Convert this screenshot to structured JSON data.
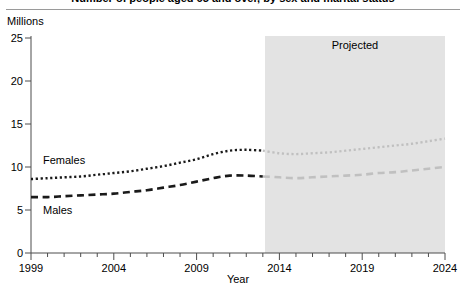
{
  "figure": {
    "title": "Number of people aged 65 and over, by sex and marital status",
    "unit_label": "Millions"
  },
  "chart_data": {
    "type": "line",
    "title": "Number of people aged 65 and over, by sex and marital status",
    "xlabel": "Year",
    "ylabel": "Millions",
    "xlim": [
      1999,
      2024
    ],
    "ylim": [
      0,
      25
    ],
    "grid": false,
    "legend_position": "inline-labels",
    "x_ticks": [
      1999,
      2004,
      2009,
      2014,
      2019,
      2024
    ],
    "x_minor_tick_interval": 1,
    "y_ticks": [
      0,
      5,
      10,
      15,
      20,
      25
    ],
    "annotations": [
      {
        "text": "Projected",
        "type": "shaded-band",
        "x_start": 2013,
        "x_end": 2024,
        "color": "#e2e2e2"
      }
    ],
    "x": [
      1999,
      2000,
      2001,
      2002,
      2003,
      2004,
      2005,
      2006,
      2007,
      2008,
      2009,
      2010,
      2011,
      2012,
      2013,
      2014,
      2015,
      2016,
      2017,
      2018,
      2019,
      2020,
      2021,
      2022,
      2023,
      2024
    ],
    "series": [
      {
        "name": "Females",
        "style": "dotted",
        "color": "#1a1a1a",
        "projected_color": "#c0c0c0",
        "projection_starts": 2013,
        "values": [
          8.6,
          8.7,
          8.8,
          8.9,
          9.1,
          9.3,
          9.5,
          9.8,
          10.1,
          10.5,
          10.9,
          11.5,
          11.9,
          12.0,
          11.9,
          11.6,
          11.5,
          11.6,
          11.7,
          11.9,
          12.1,
          12.3,
          12.5,
          12.7,
          13.0,
          13.3
        ]
      },
      {
        "name": "Males",
        "style": "dashed",
        "color": "#1a1a1a",
        "projected_color": "#c0c0c0",
        "projection_starts": 2013,
        "values": [
          6.5,
          6.5,
          6.6,
          6.7,
          6.8,
          6.9,
          7.1,
          7.3,
          7.6,
          7.9,
          8.3,
          8.7,
          9.0,
          9.0,
          8.9,
          8.8,
          8.7,
          8.8,
          8.9,
          9.0,
          9.1,
          9.3,
          9.4,
          9.6,
          9.8,
          10.0
        ]
      }
    ]
  },
  "labels": {
    "females": "Females",
    "males": "Males",
    "projected": "Projected",
    "year_axis": "Year"
  }
}
